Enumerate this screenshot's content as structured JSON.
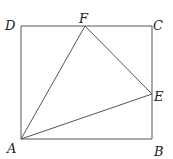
{
  "diagram": {
    "type": "geometry",
    "points": {
      "A": {
        "label": "A",
        "x": 21,
        "y": 139,
        "label_x": 7,
        "label_y": 153
      },
      "B": {
        "label": "B",
        "x": 152,
        "y": 139,
        "label_x": 154,
        "label_y": 156
      },
      "C": {
        "label": "C",
        "x": 152,
        "y": 26,
        "label_x": 153,
        "label_y": 30
      },
      "D": {
        "label": "D",
        "x": 21,
        "y": 26,
        "label_x": 5,
        "label_y": 30
      },
      "E": {
        "label": "E",
        "x": 152,
        "y": 94,
        "label_x": 154,
        "label_y": 101
      },
      "F": {
        "label": "F",
        "x": 85,
        "y": 26,
        "label_x": 79,
        "label_y": 23
      }
    },
    "segments": [
      {
        "from": "A",
        "to": "B"
      },
      {
        "from": "B",
        "to": "C"
      },
      {
        "from": "C",
        "to": "D"
      },
      {
        "from": "D",
        "to": "A"
      },
      {
        "from": "A",
        "to": "F"
      },
      {
        "from": "F",
        "to": "E"
      },
      {
        "from": "A",
        "to": "E"
      }
    ],
    "line_color": "#555555",
    "label_color": "#222222"
  }
}
